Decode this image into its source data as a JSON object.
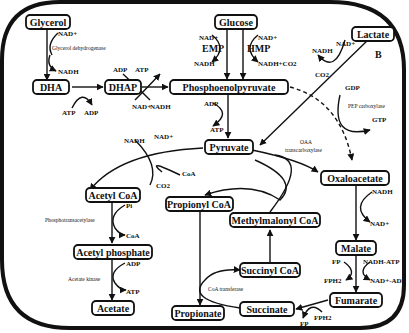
{
  "diagram": {
    "panel_label": "B",
    "nodes": {
      "glycerol": "Glycerol",
      "dha": "DHA",
      "dhap": "DHAP",
      "glucose": "Glucose",
      "pep": "Phosphoenolpyruvate",
      "lactate": "Lactate",
      "pyruvate": "Pyruvate",
      "oxaloacetate": "Oxaloacetate",
      "acetyl_coa": "Acetyl CoA",
      "acetyl_phosphate": "Acetyl phosphate",
      "acetate": "Acetate",
      "propionyl_coa": "Propionyl CoA",
      "methylmalonyl_coa": "Methylmalonyl CoA",
      "succinyl_coa": "Succinyl CoA",
      "succinate": "Succinate",
      "propionate": "Propionate",
      "malate": "Malate",
      "fumarate": "Fumarate"
    },
    "labels": {
      "glycerol_nad": "NAD+",
      "glycerol_enzyme": "Glycerol dehydrogenase",
      "glycerol_nadh": "NADH",
      "dha_atp": "ATP",
      "dha_adp": "ADP",
      "dhap_adp": "ADP",
      "dhap_atp": "ATP",
      "dhap_nad": "NAD+",
      "dhap_nadh": "NADH",
      "emp_nad": "NAD+",
      "emp": "EMP",
      "emp_nadh": "NADH",
      "hmp_nad": "NAD+",
      "hmp": "HMP",
      "hmp_nadh": "NADH+CO2",
      "pep_adp": "ADP",
      "pep_atp": "ATP",
      "lactate_nadh": "NADH",
      "lactate_nad": "NAD+",
      "co2_top": "CO2",
      "gdp": "GDP",
      "pep_carboxylase": "PEP carboxylase",
      "gtp": "GTP",
      "pyr_nadh": "NADH",
      "pyr_nad": "NAD+",
      "pyr_coa": "CoA",
      "pyr_co2": "CO2",
      "oaa_enzyme_1": "OAA",
      "oaa_enzyme_2": "transcarboxylase",
      "pi": "Pi",
      "pta": "Phosphotransacetylase",
      "coa_out": "CoA",
      "ack_adp": "ADP",
      "ack": "Acetate kinase",
      "ack_atp": "ATP",
      "oaa_nadh": "NADH",
      "oaa_nad": "NAD+",
      "fp": "FP",
      "nadh_atp": "NADH-ATP",
      "fph2": "FPH2",
      "nad_adp": "NAD+-ADP",
      "coa_transferase": "CoA transferase",
      "fum_fph2": "FPH2",
      "fum_fp": "FP"
    }
  }
}
